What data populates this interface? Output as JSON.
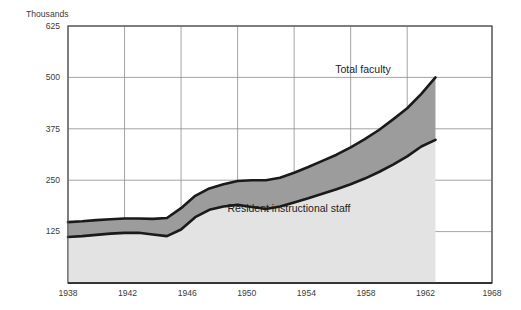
{
  "chart_data": {
    "type": "area",
    "title": "",
    "subtitle": "",
    "unit_label": "Thousands",
    "xlabel": "",
    "ylabel": "Thousands",
    "xlim": [
      1938,
      1968
    ],
    "ylim": [
      0,
      625
    ],
    "grid": true,
    "legend_position": "inline-annotations",
    "yticks": [
      125,
      250,
      375,
      500,
      625
    ],
    "ytick_labels": [
      "125",
      "250",
      "375",
      "500",
      "625"
    ],
    "xticks": [
      1938,
      1942,
      1946,
      1950,
      1954,
      1958,
      1962,
      1968
    ],
    "xtick_labels": [
      "1938",
      "1942",
      "1946",
      "1950",
      "1954",
      "1958",
      "1962",
      "1968"
    ],
    "x": [
      1938,
      1939,
      1940,
      1941,
      1942,
      1943,
      1944,
      1945,
      1946,
      1947,
      1948,
      1949,
      1950,
      1951,
      1952,
      1953,
      1954,
      1955,
      1956,
      1957,
      1958,
      1959,
      1960,
      1961,
      1962,
      1963,
      1964
    ],
    "series": [
      {
        "name": "Total faculty",
        "label": "Total faculty",
        "fill_color": "#9c9c9c",
        "line_color": "#1a1a1a",
        "values": [
          148,
          150,
          153,
          155,
          157,
          157,
          156,
          158,
          182,
          212,
          230,
          240,
          248,
          250,
          250,
          256,
          268,
          282,
          297,
          312,
          330,
          350,
          372,
          398,
          425,
          460,
          500
        ]
      },
      {
        "name": "Resident instructional staff",
        "label": "Resident instructional staff",
        "fill_color": "#e3e3e3",
        "line_color": "#1a1a1a",
        "values": [
          112,
          114,
          117,
          120,
          122,
          122,
          118,
          114,
          130,
          160,
          178,
          186,
          190,
          185,
          180,
          186,
          196,
          206,
          217,
          228,
          240,
          254,
          270,
          288,
          308,
          332,
          348
        ]
      }
    ],
    "annotations": [
      {
        "text": "Total faculty",
        "x_px": 363,
        "y_px": 73
      },
      {
        "text": "Resident instructional staff",
        "x_px": 289,
        "y_px": 212
      }
    ]
  },
  "axes": {
    "unit_caption": "Thousands",
    "y_tick_0": "625",
    "y_tick_1": "500",
    "y_tick_2": "375",
    "y_tick_3": "250",
    "y_tick_4": "125",
    "x_tick_0": "1938",
    "x_tick_1": "1942",
    "x_tick_2": "1946",
    "x_tick_3": "1950",
    "x_tick_4": "1954",
    "x_tick_5": "1958",
    "x_tick_6": "1962",
    "x_tick_7": "1968"
  },
  "colors": {
    "background": "#ffffff",
    "plot_background": "#ffffff",
    "grid": "#8d8d8d",
    "frame": "#555555",
    "axis_text": "#3b3b3b",
    "band_upper_fill": "#9c9c9c",
    "band_lower_fill": "#e3e3e3",
    "curve": "#1a1a1a"
  }
}
